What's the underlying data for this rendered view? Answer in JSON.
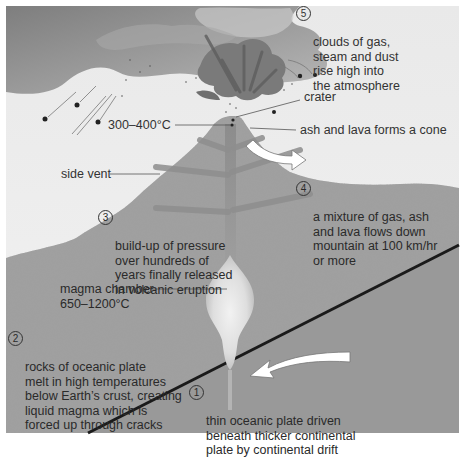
{
  "diagram": {
    "colors": {
      "sky": "#eeeeee",
      "cloud_dark": "#8c8c8c",
      "cloud_light": "#b5b5b5",
      "rock": "#9a9a9a",
      "oceanic_plate": "#999999",
      "magma_chamber": "#dcdcdc",
      "plate_boundary": "#1a1a1a",
      "arrow_fill": "#ffffff",
      "text": "#333333"
    },
    "labels": {
      "temp_crater": "300–400°C",
      "crater": "crater",
      "cone": "ash and lava forms a cone",
      "side_vent": "side vent",
      "magma_chamber": "magma chamber\n650–1200°C"
    },
    "steps": [
      {
        "number": "1",
        "text": "thin oceanic plate driven\nbeneath thicker continental\nplate by continental drift"
      },
      {
        "number": "2",
        "text": "rocks of oceanic plate\nmelt in high temperatures\nbelow Earth’s crust, creating\nliquid magma which is\nforced up through cracks"
      },
      {
        "number": "3",
        "text": "build-up of pressure\nover hundreds of\nyears finally released\nin volcanic eruption"
      },
      {
        "number": "4",
        "text": "a mixture of gas, ash\nand lava flows down\nmountain at 100 km/hr\nor more"
      },
      {
        "number": "5",
        "text": "clouds of gas,\nsteam and dust\nrise high into\nthe atmosphere"
      }
    ]
  }
}
